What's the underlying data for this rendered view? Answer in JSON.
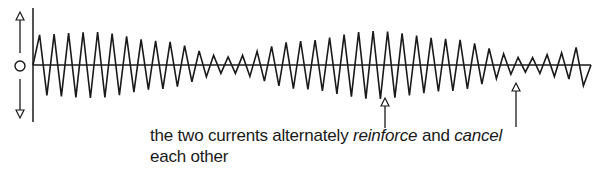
{
  "diagram": {
    "axis": {
      "x_start": 33,
      "x_end": 591,
      "baseline_y": 65,
      "vertical_top": 8,
      "vertical_bottom": 122
    },
    "left_indicator": {
      "symbol": "O",
      "up_arrow": "up-arrow",
      "down_arrow": "down-arrow"
    },
    "wave": {
      "period_px": 14.5,
      "phase_start_x": 36,
      "envelope": [
        {
          "x": 33,
          "amp": 30
        },
        {
          "x": 95,
          "amp": 33
        },
        {
          "x": 160,
          "amp": 24
        },
        {
          "x": 228,
          "amp": 8
        },
        {
          "x": 300,
          "amp": 24
        },
        {
          "x": 375,
          "amp": 34
        },
        {
          "x": 450,
          "amp": 26
        },
        {
          "x": 528,
          "amp": 7
        },
        {
          "x": 560,
          "amp": 12
        },
        {
          "x": 590,
          "amp": 22
        }
      ],
      "color": "#1a1a1a"
    },
    "arrows": [
      {
        "name": "reinforce-pointer",
        "x": 385,
        "tip_y": 98,
        "end_y": 128
      },
      {
        "name": "cancel-pointer",
        "x": 516,
        "tip_y": 83,
        "end_y": 127
      }
    ]
  },
  "caption": {
    "part1": "the two currents alternately ",
    "reinforce": "reinforce",
    "part2": " and ",
    "cancel": "cancel",
    "line2": "each other"
  }
}
